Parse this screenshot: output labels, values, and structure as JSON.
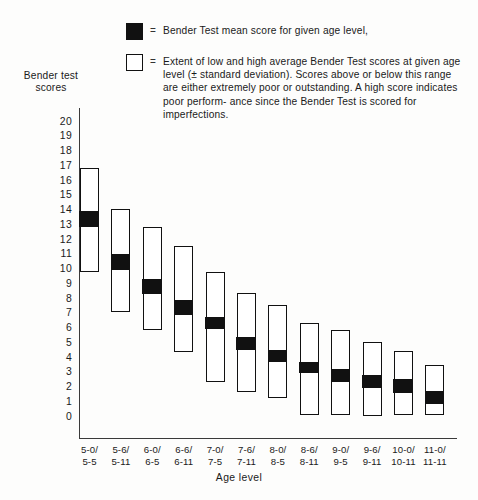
{
  "legend": {
    "items": [
      {
        "icon": "filled-square-icon",
        "swatch": "filled",
        "equals": "=",
        "text": "Bender Test mean score for given age level,"
      },
      {
        "icon": "hollow-square-icon",
        "swatch": "hollow",
        "equals": "=",
        "text": "Extent of low and high average Bender Test scores at given age level (± standard deviation). Scores above or below this range are either extremely poor or outstanding. A high score indicates poor perform- ance since the Bender Test is scored for imperfections."
      }
    ]
  },
  "axes": {
    "y_title": "Bender test scores",
    "x_title": "Age level"
  },
  "chart_data": {
    "type": "bar",
    "title": "",
    "subtitle": "",
    "xlabel": "Age level",
    "ylabel": "Bender test scores",
    "ylim": [
      0,
      20
    ],
    "ytick_labels": [
      "20",
      "19",
      "18",
      "17",
      "16",
      "15",
      "14",
      "13",
      "12",
      "11",
      "10",
      "9",
      "8",
      "7",
      "6",
      "5",
      "4",
      "3",
      "2",
      "1",
      "0"
    ],
    "ytick_values": [
      20,
      19,
      18,
      17,
      16,
      15,
      14,
      13,
      12,
      11,
      10,
      9,
      8,
      7,
      6,
      5,
      4,
      3,
      2,
      1,
      0
    ],
    "grid": false,
    "legend_position": "top",
    "categories": [
      "5-0/\n5-5",
      "5-6/\n5-11",
      "6-0/\n6-5",
      "6-6/\n6-11",
      "7-0/\n7-5",
      "7-6/\n7-11",
      "8-0/\n8-5",
      "8-6/\n8-11",
      "9-0/\n9-5",
      "9-6/\n9-11",
      "10-0/\n10-11",
      "11-0/\n11-11"
    ],
    "category_lines": [
      [
        "5-0/",
        "5-5"
      ],
      [
        "5-6/",
        "5-11"
      ],
      [
        "6-0/",
        "6-5"
      ],
      [
        "6-6/",
        "6-11"
      ],
      [
        "7-0/",
        "7-5"
      ],
      [
        "7-6/",
        "7-11"
      ],
      [
        "8-0/",
        "8-5"
      ],
      [
        "8-6/",
        "8-11"
      ],
      [
        "9-0/",
        "9-5"
      ],
      [
        "9-6/",
        "9-11"
      ],
      [
        "10-0/",
        "10-11"
      ],
      [
        "11-0/",
        "11-11"
      ]
    ],
    "series": [
      {
        "name": "Extent of low and high average Bender Test scores (± standard deviation)",
        "kind": "range",
        "low": [
          9.7,
          7.0,
          5.8,
          4.3,
          2.3,
          1.6,
          1.2,
          0.0,
          0.0,
          0.0,
          0.0,
          0.0
        ],
        "high": [
          16.8,
          14.0,
          12.8,
          11.5,
          9.7,
          8.3,
          7.5,
          6.3,
          5.8,
          5.0,
          4.4,
          3.4
        ]
      },
      {
        "name": "Bender Test mean score for given age level",
        "kind": "band",
        "band_low": [
          12.7,
          9.8,
          8.2,
          6.8,
          5.8,
          4.4,
          3.6,
          2.8,
          2.2,
          1.8,
          1.5,
          0.7
        ],
        "band_high": [
          13.8,
          10.9,
          9.2,
          7.8,
          6.6,
          5.3,
          4.4,
          3.6,
          3.1,
          2.7,
          2.4,
          1.6
        ],
        "means": [
          13.2,
          10.3,
          8.7,
          7.3,
          6.2,
          4.8,
          4.0,
          3.2,
          2.6,
          2.2,
          1.9,
          1.1
        ]
      }
    ]
  },
  "colors": {
    "ink": "#111111",
    "axis": "#3a3a3a",
    "paper": "#fdfdfc"
  }
}
